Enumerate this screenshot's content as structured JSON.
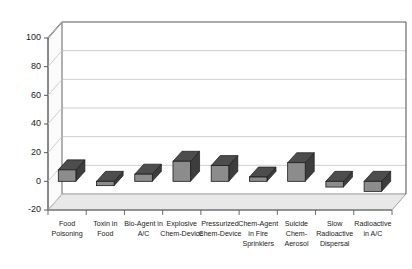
{
  "chart_data": {
    "type": "bar",
    "title": "",
    "subtitle": "",
    "xlabel": "",
    "ylabel": "",
    "ylim": [
      -20,
      100
    ],
    "yticks": [
      100,
      80,
      60,
      40,
      20,
      0,
      -20
    ],
    "ytick_labels": [
      "100",
      "80",
      "60",
      "40",
      "20",
      "0",
      "-20"
    ],
    "grid": true,
    "grid_axis": "y",
    "legend": false,
    "legend_position": "none",
    "three_d": true,
    "categories": [
      "Food Poisoning",
      "Toxin in Food",
      "Bio-Agent in A/C",
      "Explosive Chem-Device",
      "Pressurized Chem-Device",
      "Chem-Agent in Fire Sprinklers",
      "Suicide Chem-Aerosol",
      "Slow Radioactive Dispersal",
      "Radioactive in A/C"
    ],
    "category_label_lines": [
      [
        "Food",
        "Poisoning"
      ],
      [
        "Toxin in",
        "Food"
      ],
      [
        "Bio-Agent in",
        "A/C"
      ],
      [
        "Explosive",
        "Chem-Device"
      ],
      [
        "Pressurized",
        "Chem-Device"
      ],
      [
        "Chem-Agent",
        "in Fire",
        "Sprinklers"
      ],
      [
        "Suicide",
        "Chem-",
        "Aerosol"
      ],
      [
        "Slow",
        "Radioactive",
        "Dispersal"
      ],
      [
        "Radioactive",
        "in A/C"
      ]
    ],
    "values": [
      8,
      -3,
      5,
      14,
      11,
      3,
      13,
      -4,
      -7
    ],
    "series": [
      {
        "name": "",
        "values": [
          8,
          -3,
          5,
          14,
          11,
          3,
          13,
          -4,
          -7
        ]
      }
    ]
  },
  "style": {
    "bar_front_color": "#8c8c8c",
    "bar_top_color": "#4d4d4d",
    "bar_side_color": "#3d3d3d",
    "bar_edge_color": "#1a1a1a",
    "grid_color": "#c9c9c9",
    "axis_color": "#5a5a5a",
    "floor_color": "#e8e8e8",
    "wall_color": "#ffffff",
    "background": "#ffffff",
    "text_color": "#1a1a1a"
  }
}
